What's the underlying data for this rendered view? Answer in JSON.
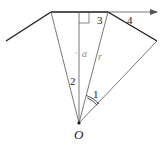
{
  "diagram": {
    "type": "geometry",
    "labels": {
      "origin": "O",
      "perpendicular": "a",
      "slant": "r",
      "angle_1": "1",
      "region_2": "2",
      "region_3": "3",
      "region_4": "4",
      "a_marker": "↑"
    },
    "colors": {
      "line": "#1a1a1a",
      "thin_line": "#555555",
      "faint_text": "#8a8a8a"
    }
  }
}
